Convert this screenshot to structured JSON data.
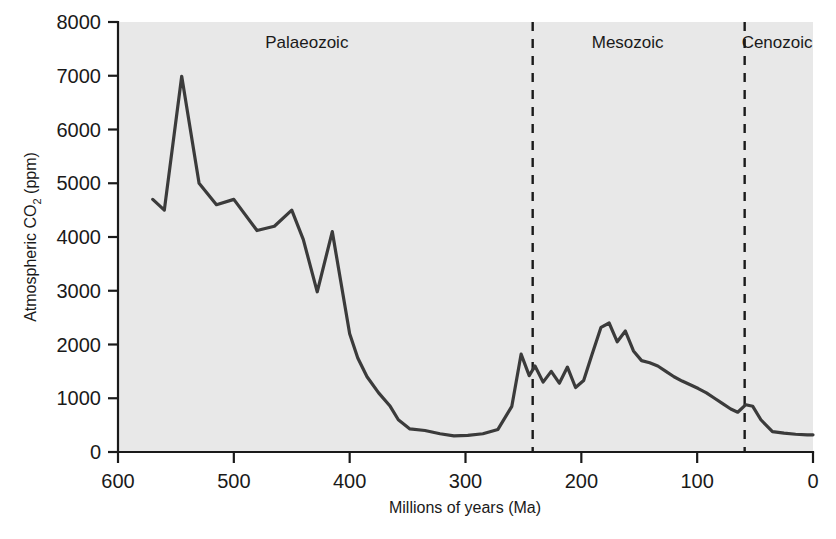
{
  "chart_data": {
    "type": "line",
    "title": "",
    "xlabel": "Millions of years (Ma)",
    "ylabel": "Atmospheric CO2 (ppm)",
    "ylabel_parts": {
      "pre": "Atmospheric CO",
      "sub": "2",
      "post": " (ppm)"
    },
    "xlim": [
      600,
      0
    ],
    "ylim": [
      0,
      8000
    ],
    "x_ticks": [
      600,
      500,
      400,
      300,
      200,
      100,
      0
    ],
    "y_ticks": [
      0,
      1000,
      2000,
      3000,
      4000,
      5000,
      6000,
      7000,
      8000
    ],
    "x_axis_reversed": true,
    "grid": false,
    "legend": null,
    "series_name": "Atmospheric CO2",
    "line_color": "#3b3b3b",
    "plot_background": "#e8e8e8",
    "x": [
      570,
      560,
      545,
      530,
      515,
      500,
      480,
      465,
      450,
      440,
      428,
      415,
      400,
      393,
      385,
      375,
      365,
      358,
      348,
      335,
      322,
      310,
      298,
      285,
      272,
      260,
      252,
      245,
      240,
      233,
      226,
      219,
      212,
      205,
      198,
      191,
      183,
      176,
      169,
      162,
      155,
      148,
      141,
      134,
      127,
      120,
      113,
      106,
      99,
      92,
      85,
      78,
      71,
      65,
      58,
      52,
      45,
      35,
      25,
      15,
      5,
      0
    ],
    "y": [
      4700,
      4500,
      6990,
      5000,
      4600,
      4700,
      4120,
      4200,
      4500,
      3950,
      2980,
      4100,
      2200,
      1750,
      1400,
      1100,
      850,
      600,
      430,
      400,
      340,
      300,
      310,
      340,
      420,
      850,
      1820,
      1420,
      1600,
      1300,
      1500,
      1280,
      1580,
      1200,
      1330,
      1800,
      2320,
      2400,
      2050,
      2250,
      1880,
      1700,
      1660,
      1600,
      1500,
      1400,
      1320,
      1250,
      1180,
      1100,
      1000,
      900,
      800,
      740,
      880,
      850,
      600,
      380,
      350,
      330,
      320,
      320
    ],
    "eras": [
      {
        "name": "Palaeozoic",
        "start_ma": 600,
        "end_ma": 242,
        "label_ma": 437
      },
      {
        "name": "Mesozoic",
        "start_ma": 242,
        "end_ma": 59,
        "label_ma": 160
      },
      {
        "name": "Cenozoic",
        "start_ma": 59,
        "end_ma": 0,
        "label_ma": 31
      }
    ],
    "era_boundaries_ma": [
      242,
      59
    ],
    "peak_value": 7000,
    "peak_ma": 545,
    "minimum_value": 290
  },
  "axes": {
    "x_title": "Millions of years (Ma)",
    "y_title_pre": "Atmospheric CO",
    "y_title_sub": "2",
    "y_title_post": " (ppm)"
  }
}
